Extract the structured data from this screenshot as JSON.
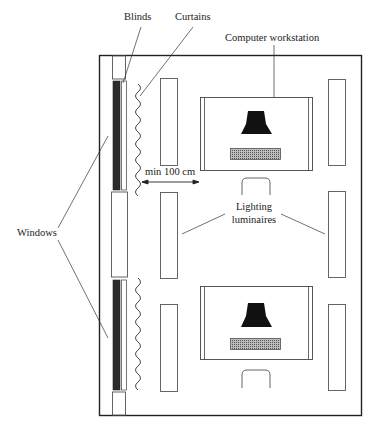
{
  "diagram": {
    "type": "floor-plan",
    "labels": {
      "blinds": "Blinds",
      "curtains": "Curtains",
      "computer_workstation": "Computer workstation",
      "min_distance": "min 100 cm",
      "lighting_luminaires_line1": "Lighting",
      "lighting_luminaires_line2": "luminaires",
      "windows": "Windows"
    },
    "colors": {
      "line": "#222222",
      "blind_dark": "#2b2b2b",
      "thin_line": "#666666",
      "keyboard_fill": "#9a9a9a",
      "background": "#ffffff"
    },
    "elements": {
      "windows_count": 2,
      "workstations_count": 2,
      "luminaires_count": 6
    }
  }
}
